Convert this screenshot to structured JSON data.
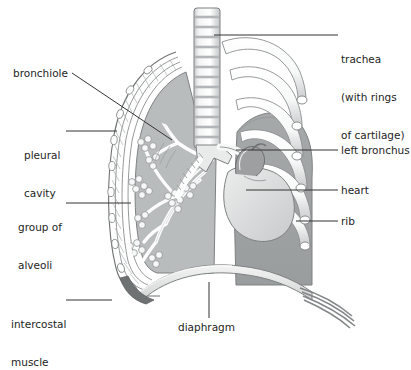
{
  "diagram": {
    "background_color": "#ffffff",
    "text_color": "#1e1e1e",
    "leader_line_color": "#333333"
  },
  "labels": {
    "trachea": {
      "line1": "trachea",
      "line2": "(with rings",
      "line3": "of cartilage)",
      "side": "right"
    },
    "left_bronchus": {
      "text": "left bronchus",
      "side": "right"
    },
    "heart": {
      "text": "heart",
      "side": "right"
    },
    "rib": {
      "text": "rib",
      "side": "right"
    },
    "bronchiole": {
      "text": "bronchiole",
      "side": "left"
    },
    "pleural_cavity": {
      "line1": "pleural",
      "line2": "cavity",
      "side": "left"
    },
    "group_of_alveoli": {
      "line1": "group of",
      "line2": "alveoli",
      "side": "left"
    },
    "intercostal_muscle": {
      "line1": "intercostal",
      "line2": "muscle",
      "side": "left"
    },
    "diaphragm": {
      "text": "diaphragm",
      "side": "bottom"
    }
  },
  "palette": {
    "lung_right_fill": "#b9bcbd",
    "lung_left_fill": "#9d9fa0",
    "rib_fill": "#fbfbfb",
    "rib_shade": "#cfd1d2",
    "trachea_light": "#ededed",
    "trachea_band": "#b7babb",
    "heart_fill": "#dedfe0",
    "heart_vessel": "#8e9192",
    "diaphragm_band": "#e8e9e9",
    "diaphragm_fiber": "#6f7273",
    "pleura_line": "#8a8d8e",
    "alveoli_fill": "#f4f5f5",
    "outline": "#6e7172"
  }
}
